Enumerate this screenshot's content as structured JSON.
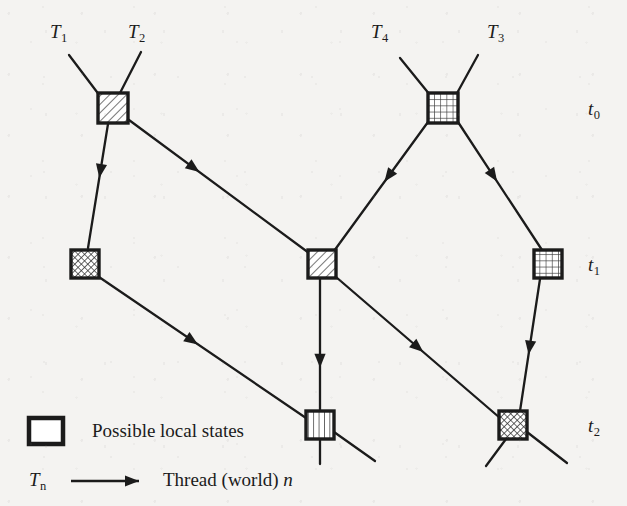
{
  "figure": {
    "kind": "thread-world-state-lattice",
    "background_color": "#f4f3f1",
    "ink_color": "#1b1b1b",
    "width": 627,
    "height": 506
  },
  "thread_labels": [
    {
      "id": "T1",
      "base": "T",
      "sub": "1",
      "x": 50,
      "y": 22
    },
    {
      "id": "T2",
      "base": "T",
      "sub": "2",
      "x": 128,
      "y": 22
    },
    {
      "id": "T4",
      "base": "T",
      "sub": "4",
      "x": 371,
      "y": 22
    },
    {
      "id": "T3",
      "base": "T",
      "sub": "3",
      "x": 487,
      "y": 22
    }
  ],
  "time_labels": [
    {
      "id": "t0",
      "base": "t",
      "sub": "0",
      "x": 588,
      "y": 99
    },
    {
      "id": "t1",
      "base": "t",
      "sub": "1",
      "x": 588,
      "y": 255
    },
    {
      "id": "t2",
      "base": "t",
      "sub": "2",
      "x": 588,
      "y": 416
    }
  ],
  "nodes": [
    {
      "id": "n-t0-left",
      "row": "t0",
      "x": 113,
      "y": 108,
      "size": 30,
      "fill": "diagonal-hatch"
    },
    {
      "id": "n-t0-right",
      "row": "t0",
      "x": 443,
      "y": 108,
      "size": 30,
      "fill": "grid"
    },
    {
      "id": "n-t1-left",
      "row": "t1",
      "x": 85,
      "y": 264,
      "size": 28,
      "fill": "crosshatch"
    },
    {
      "id": "n-t1-center",
      "row": "t1",
      "x": 322,
      "y": 264,
      "size": 28,
      "fill": "diagonal-hatch"
    },
    {
      "id": "n-t1-right",
      "row": "t1",
      "x": 548,
      "y": 264,
      "size": 28,
      "fill": "grid"
    },
    {
      "id": "n-t2-center",
      "row": "t2",
      "x": 320,
      "y": 425,
      "size": 28,
      "fill": "vertical-stripes"
    },
    {
      "id": "n-t2-right",
      "row": "t2",
      "x": 513,
      "y": 425,
      "size": 28,
      "fill": "crosshatch"
    }
  ],
  "edges": [
    {
      "id": "e-T1-in",
      "from": [
        69,
        55
      ],
      "to": [
        100,
        96
      ],
      "arrow": false
    },
    {
      "id": "e-T2-in",
      "from": [
        141,
        52
      ],
      "to": [
        120,
        93
      ],
      "arrow": false
    },
    {
      "id": "e-T4-in",
      "from": [
        400,
        58
      ],
      "to": [
        430,
        95
      ],
      "arrow": false
    },
    {
      "id": "e-T3-in",
      "from": [
        478,
        55
      ],
      "to": [
        456,
        95
      ],
      "arrow": false
    },
    {
      "id": "e-t0L-t1L",
      "from": [
        108,
        124
      ],
      "to": [
        88,
        248
      ],
      "arrow": true,
      "arrow_at": 0.38
    },
    {
      "id": "e-t0L-t1C",
      "from": [
        129,
        120
      ],
      "to": [
        309,
        253
      ],
      "arrow": true,
      "arrow_at": 0.36
    },
    {
      "id": "e-t0R-t1C",
      "from": [
        428,
        122
      ],
      "to": [
        334,
        251
      ],
      "arrow": true,
      "arrow_at": 0.42
    },
    {
      "id": "e-t0R-t1R",
      "from": [
        458,
        122
      ],
      "to": [
        542,
        250
      ],
      "arrow": true,
      "arrow_at": 0.42
    },
    {
      "id": "e-t1L-t2C",
      "from": [
        99,
        277
      ],
      "to": [
        306,
        418
      ],
      "arrow": true,
      "arrow_at": 0.45
    },
    {
      "id": "e-t1C-t2C",
      "from": [
        320,
        279
      ],
      "to": [
        320,
        411
      ],
      "arrow": true,
      "arrow_at": 0.62
    },
    {
      "id": "e-t1C-t2R",
      "from": [
        336,
        277
      ],
      "to": [
        500,
        418
      ],
      "arrow": true,
      "arrow_at": 0.5
    },
    {
      "id": "e-t1R-t2R",
      "from": [
        540,
        279
      ],
      "to": [
        520,
        411
      ],
      "arrow": true,
      "arrow_at": 0.52
    },
    {
      "id": "e-t2C-out",
      "from": [
        334,
        432
      ],
      "to": [
        375,
        461
      ],
      "arrow": false
    },
    {
      "id": "e-t2C-down",
      "from": [
        320,
        439
      ],
      "to": [
        320,
        464
      ],
      "arrow": false
    },
    {
      "id": "e-t2R-outA",
      "from": [
        527,
        432
      ],
      "to": [
        567,
        463
      ],
      "arrow": false
    },
    {
      "id": "e-t2R-outB",
      "from": [
        506,
        439
      ],
      "to": [
        486,
        466
      ],
      "arrow": false
    }
  ],
  "legend": {
    "state_swatch": {
      "id": "legend-state-box",
      "fill": "none"
    },
    "state_text": "Possible local states",
    "thread_symbol_base": "T",
    "thread_symbol_sub": "n",
    "thread_text_prefix": "Thread (world) ",
    "thread_text_italic_suffix": "n"
  }
}
